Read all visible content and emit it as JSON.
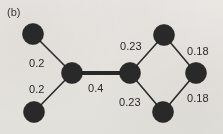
{
  "figure": {
    "panel_label": "(b)",
    "background_color": "#f3f1ef",
    "node_color": "#2c2c2c",
    "edge_color": "#2e2e2e",
    "label_color": "#2a2a2a"
  },
  "chart_data": {
    "type": "diagram",
    "diagram_kind": "weighted-undirected-graph",
    "title": "(b)",
    "xlabel": "",
    "ylabel": "",
    "grid": false,
    "legend": null,
    "nodes": [
      {
        "id": "n1",
        "label": "",
        "x": 33,
        "y": 34,
        "r": 10.5
      },
      {
        "id": "n2",
        "label": "",
        "x": 34,
        "y": 112,
        "r": 10.5
      },
      {
        "id": "n3",
        "label": "",
        "x": 72,
        "y": 73,
        "r": 10.5
      },
      {
        "id": "n4",
        "label": "",
        "x": 130,
        "y": 73,
        "r": 10.5
      },
      {
        "id": "n5",
        "label": "",
        "x": 164,
        "y": 35,
        "r": 10.5
      },
      {
        "id": "n6",
        "label": "",
        "x": 196,
        "y": 73,
        "r": 10.5
      },
      {
        "id": "n7",
        "label": "",
        "x": 163,
        "y": 112,
        "r": 10.5
      }
    ],
    "edges": [
      {
        "source": "n1",
        "target": "n3",
        "weight": 0.2,
        "weight_text": "0.2",
        "style": "thin",
        "label_x": 29,
        "label_y": 57
      },
      {
        "source": "n2",
        "target": "n3",
        "weight": 0.2,
        "weight_text": "0.2",
        "style": "thin",
        "label_x": 29,
        "label_y": 83
      },
      {
        "source": "n3",
        "target": "n4",
        "weight": 0.4,
        "weight_text": "0.4",
        "style": "thick",
        "label_x": 88,
        "label_y": 82
      },
      {
        "source": "n4",
        "target": "n5",
        "weight": 0.23,
        "weight_text": "0.23",
        "style": "thin",
        "label_x": 120,
        "label_y": 40
      },
      {
        "source": "n4",
        "target": "n7",
        "weight": 0.23,
        "weight_text": "0.23",
        "style": "thin",
        "label_x": 119,
        "label_y": 96
      },
      {
        "source": "n5",
        "target": "n6",
        "weight": 0.18,
        "weight_text": "0.18",
        "style": "thin",
        "label_x": 187,
        "label_y": 45
      },
      {
        "source": "n7",
        "target": "n6",
        "weight": 0.18,
        "weight_text": "0.18",
        "style": "thin",
        "label_x": 187,
        "label_y": 92
      }
    ],
    "edge_weights": [
      0.2,
      0.2,
      0.4,
      0.23,
      0.23,
      0.18,
      0.18
    ],
    "node_count": 7,
    "edge_count": 7
  }
}
